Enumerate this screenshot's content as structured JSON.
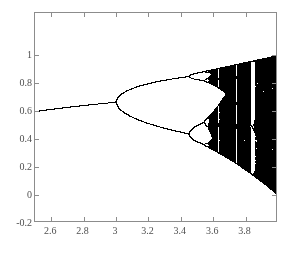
{
  "chart_data": {
    "type": "scatter",
    "title": "",
    "subtitle": "",
    "xlabel": "",
    "ylabel": "",
    "xlim": [
      2.5,
      4.0
    ],
    "ylim": [
      -0.2,
      1.3
    ],
    "grid": false,
    "legend": null,
    "x_ticks": [
      2.6,
      2.8,
      3,
      3.2,
      3.4,
      3.6,
      3.8
    ],
    "x_tick_labels": [
      "2.6",
      "2.8",
      "3",
      "3.2",
      "3.4",
      "3.6",
      "3.8"
    ],
    "y_ticks": [
      -0.2,
      0,
      0.2,
      0.4,
      0.6,
      0.8,
      1
    ],
    "y_tick_labels": [
      "-0.2",
      "0",
      "0.2",
      "0.4",
      "0.6",
      "0.8",
      "1"
    ],
    "series": [
      {
        "name": "logistic-map-attractor",
        "color": "#000000",
        "map": "logistic",
        "r_min": 2.5,
        "r_max": 4.0,
        "r_steps": 1400,
        "x0": 0.35,
        "transient_iterations": 300,
        "plot_iterations": 260
      }
    ],
    "annotations": [
      {
        "label": "first period-doubling (period 1 to 2)",
        "r": 3.0,
        "x": 0.667
      },
      {
        "label": "period 2 to 4",
        "r": 3.449,
        "x": 0.44
      },
      {
        "label": "onset of chaos (Feigenbaum point)",
        "r": 3.5699,
        "x": 0.5
      },
      {
        "label": "period-3 window",
        "r": 3.83,
        "x": 0.5
      }
    ],
    "sample_points": [
      {
        "r": 2.5,
        "branches": [
          0.6
        ]
      },
      {
        "r": 2.8,
        "branches": [
          0.643
        ]
      },
      {
        "r": 3.0,
        "branches": [
          0.667
        ]
      },
      {
        "r": 3.2,
        "branches": [
          0.799,
          0.513
        ]
      },
      {
        "r": 3.4,
        "branches": [
          0.842,
          0.452
        ]
      },
      {
        "r": 3.5,
        "branches": [
          0.875,
          0.827,
          0.501,
          0.383
        ]
      },
      {
        "r": 4.0,
        "branches": [
          0.0,
          1.0
        ]
      }
    ]
  },
  "figure": {
    "plot_box": {
      "left": 34,
      "top": 12,
      "width": 243,
      "height": 210
    },
    "axis_color": "#8c8c8c",
    "tick_color": "#8c8c8c",
    "label_color": "#4f4f4f",
    "background": "#ffffff",
    "data_color": "#000000"
  }
}
